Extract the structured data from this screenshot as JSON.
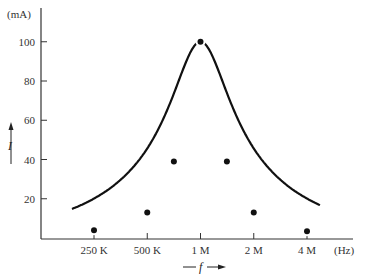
{
  "chart_data": {
    "type": "line",
    "title": "",
    "xlabel": "f",
    "ylabel": "I",
    "x_unit": "(Hz)",
    "y_unit": "(mA)",
    "x_scale": "log2",
    "x_ticks": [
      "250 K",
      "500 K",
      "1 M",
      "2 M",
      "4 M"
    ],
    "y_ticks": [
      20,
      40,
      60,
      80,
      100
    ],
    "ylim": [
      0,
      110
    ],
    "grid": false,
    "legend": null,
    "series": [
      {
        "name": "I vs f (resonance curve)",
        "points": [
          {
            "x": "250 K",
            "y": 4
          },
          {
            "x": "500 K",
            "y": 13
          },
          {
            "x": "707 K",
            "y": 39
          },
          {
            "x": "1 M",
            "y": 100
          },
          {
            "x": "1.41 M",
            "y": 39
          },
          {
            "x": "2 M",
            "y": 13
          },
          {
            "x": "4 M",
            "y": 3.5
          }
        ]
      }
    ]
  }
}
